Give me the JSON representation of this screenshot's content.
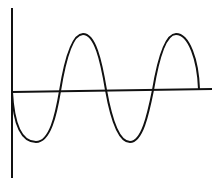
{
  "diagram": {
    "type": "sine-wave-sketch",
    "colors": {
      "background": "#ffffff",
      "stroke": "#111111"
    },
    "axes": {
      "vertical": {
        "x": 12,
        "y1": 8,
        "y2": 178
      },
      "horizontal": {
        "x1": 12,
        "y1": 92,
        "x2": 212,
        "y2": 89
      }
    },
    "wave": {
      "start": [
        12,
        92
      ],
      "troughs": [
        [
          36,
          142
        ],
        [
          130,
          142
        ]
      ],
      "peaks": [
        [
          83,
          34
        ],
        [
          176,
          34
        ]
      ],
      "axis_crossings": [
        [
          60,
          91
        ],
        [
          106,
          90
        ],
        [
          153,
          90
        ]
      ],
      "end": [
        199,
        89
      ]
    }
  }
}
